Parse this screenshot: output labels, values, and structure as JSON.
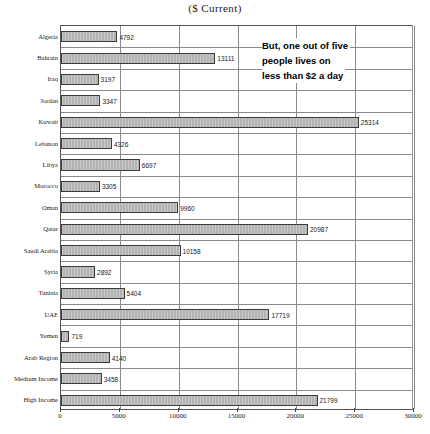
{
  "chart_data": {
    "type": "bar",
    "orientation": "horizontal",
    "title": "($ Current)",
    "xlabel": "",
    "ylabel": "",
    "xlim": [
      0,
      30000
    ],
    "xticks": [
      0,
      5000,
      10000,
      15000,
      20000,
      25000,
      30000
    ],
    "xtick_labels": [
      "0",
      "5000",
      "10000",
      "15000",
      "20000",
      "25000",
      "30000"
    ],
    "grid": true,
    "legend": "none",
    "bar_color": "#b3b3b3",
    "bar_edge_color": "#3b3b3b",
    "categories": [
      "Algeria",
      "Bahrain",
      "Iraq",
      "Jordan",
      "Kuwait",
      "Lebanon",
      "Libya",
      "Morocco",
      "Oman",
      "Qatar",
      "Saudi Arabia",
      "Syria",
      "Tunisia",
      "UAE",
      "Yemen",
      "Arab Region",
      "Medium Income",
      "High Income"
    ],
    "values": [
      4792,
      13111,
      3197,
      3347,
      25314,
      4326,
      6697,
      3305,
      9960,
      20987,
      10158,
      2892,
      5404,
      17719,
      719,
      4140,
      3458,
      21799
    ],
    "value_labels": [
      "4792",
      "13111",
      "3197",
      "3347",
      "25314",
      "4326",
      "6697",
      "3305",
      "9960",
      "20987",
      "10158",
      "2892",
      "5404",
      "17719",
      "719",
      "4140",
      "3458",
      "21799"
    ],
    "annotations": [
      {
        "name": "poverty-callout",
        "lines": [
          "But, one out of five",
          "people lives on",
          "less than $2 a day"
        ]
      }
    ]
  },
  "caption": {
    "text": ""
  }
}
